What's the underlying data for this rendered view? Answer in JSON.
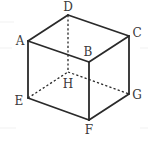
{
  "figure": {
    "vertices": {
      "A": {
        "label": "A",
        "x": 28,
        "y": 41,
        "label_x": 20,
        "label_y": 41
      },
      "B": {
        "label": "B",
        "x": 89,
        "y": 62,
        "label_x": 88,
        "label_y": 52
      },
      "C": {
        "label": "C",
        "x": 129,
        "y": 36,
        "label_x": 137,
        "label_y": 33
      },
      "D": {
        "label": "D",
        "x": 68,
        "y": 15,
        "label_x": 68,
        "label_y": 7
      },
      "E": {
        "label": "E",
        "x": 28,
        "y": 98,
        "label_x": 19,
        "label_y": 101
      },
      "F": {
        "label": "F",
        "x": 89,
        "y": 120,
        "label_x": 89,
        "label_y": 130
      },
      "G": {
        "label": "G",
        "x": 129,
        "y": 94,
        "label_x": 137,
        "label_y": 95
      },
      "H": {
        "label": "H",
        "x": 68,
        "y": 72,
        "label_x": 68,
        "label_y": 84
      }
    },
    "solid_edges": [
      "AB",
      "BC",
      "CD",
      "DA",
      "AE",
      "BF",
      "CG",
      "EF",
      "FG"
    ],
    "hidden_edges": [
      "DH",
      "EH",
      "HG"
    ],
    "colors": {
      "stroke": "#2a2a2a",
      "label": "#3a3a3a",
      "background": "#ffffff"
    }
  }
}
